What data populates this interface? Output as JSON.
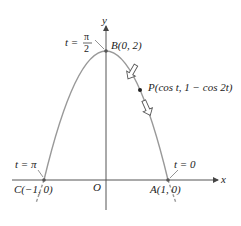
{
  "diagram": {
    "type": "parametric-curve",
    "curve": "x = cos t, y = 1 - cos 2t (parabola y = 2 - 2x^2)",
    "axes": {
      "x_label": "x",
      "y_label": "y",
      "origin_label": "O"
    },
    "points": {
      "B": {
        "label": "B(0, 2)",
        "param": "t =",
        "param_num": "π",
        "param_den": "2"
      },
      "A": {
        "label": "A(1, 0)",
        "param": "t = 0"
      },
      "C": {
        "label": "C(−1, 0)",
        "param": "t = π"
      },
      "P": {
        "label": "P(cos t, 1 − cos 2t)"
      }
    },
    "colors": {
      "curve": "#999999",
      "axes": "#555555",
      "point": "#333333"
    }
  }
}
